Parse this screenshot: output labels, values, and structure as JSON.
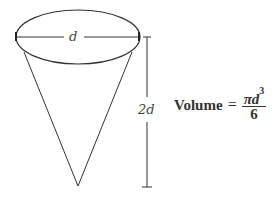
{
  "diagram": {
    "shape": "cone",
    "diameter_label": "d",
    "height_label": "2d",
    "formula": {
      "lhs": "Volume",
      "equals": "=",
      "numerator": "πd",
      "exponent": "3",
      "denominator": "6"
    },
    "colors": {
      "stroke": "#333333",
      "text": "#444444",
      "background": "#ffffff"
    }
  }
}
